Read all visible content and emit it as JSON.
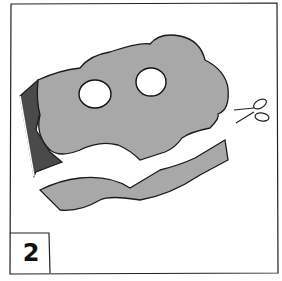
{
  "panel": {
    "step_number": "2",
    "subject": "paper mask being cut from a sheet with scissors",
    "icons": [
      "scissors-icon"
    ],
    "colors": {
      "paper": "#a6a6a6",
      "paper_dark": "#4a4a4a",
      "outline": "#1a1a1a",
      "background": "#ffffff"
    }
  }
}
